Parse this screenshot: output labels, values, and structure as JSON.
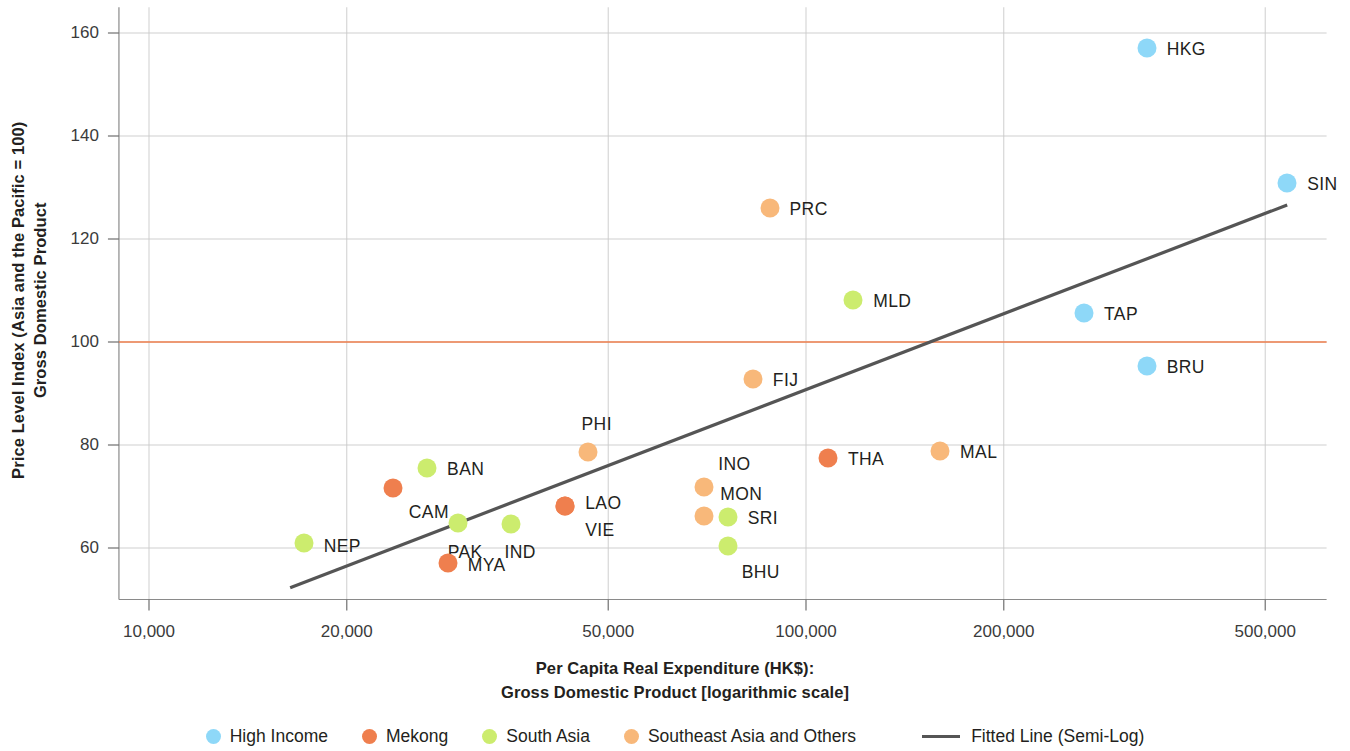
{
  "chart_data": {
    "type": "scatter",
    "title": "",
    "xlabel": "Per Capita Real Expenditure (HK$): Gross Domestic Product [logarithmic scale]",
    "xlabel_line1": "Per Capita Real Expenditure (HK$):",
    "xlabel_line2": "Gross Domestic Product [logarithmic scale]",
    "ylabel": "Price Level Index (Asia and the Pacific = 100) Gross Domestic Product",
    "ylabel_line1": "Price Level Index (Asia and the Pacific = 100)",
    "ylabel_line2": "Gross Domestic Product",
    "xscale": "log",
    "xlim": [
      9000,
      620000
    ],
    "ylim": [
      50,
      165
    ],
    "xticks": [
      10000,
      20000,
      50000,
      100000,
      200000,
      500000
    ],
    "xtick_labels": [
      "10,000",
      "20,000",
      "50,000",
      "100,000",
      "200,000",
      "500,000"
    ],
    "yticks": [
      60,
      80,
      100,
      120,
      140,
      160
    ],
    "ytick_labels": [
      "60",
      "80",
      "100",
      "120",
      "140",
      "160"
    ],
    "grid": true,
    "reference_line": {
      "y": 100,
      "color": "#ef7f4e"
    },
    "fitted_line": {
      "label": "Fitted Line (Semi-Log)",
      "color": "#555555",
      "x_start": 16400,
      "y_start": 52.3,
      "x_end": 540000,
      "y_end": 126.6
    },
    "groups": [
      {
        "name": "High Income",
        "color": "#8ed8f8"
      },
      {
        "name": "Mekong",
        "color": "#ef7f4e"
      },
      {
        "name": "South Asia",
        "color": "#ccec6e"
      },
      {
        "name": "Southeast Asia and Others",
        "color": "#f8b87a"
      }
    ],
    "points": [
      {
        "code": "HKG",
        "group": "High Income",
        "x": 330000,
        "y": 157.0,
        "label_dx": 20,
        "label_dy": 1
      },
      {
        "code": "SIN",
        "group": "High Income",
        "x": 540000,
        "y": 130.8,
        "label_dx": 20,
        "label_dy": 1
      },
      {
        "code": "TAP",
        "group": "High Income",
        "x": 265000,
        "y": 105.6,
        "label_dx": 20,
        "label_dy": 1
      },
      {
        "code": "BRU",
        "group": "High Income",
        "x": 330000,
        "y": 95.4,
        "label_dx": 20,
        "label_dy": 1
      },
      {
        "code": "PRC",
        "group": "Southeast Asia and Others",
        "x": 88000,
        "y": 126.0,
        "label_dx": 20,
        "label_dy": 1
      },
      {
        "code": "MLD",
        "group": "South Asia",
        "x": 118000,
        "y": 108.2,
        "label_dx": 20,
        "label_dy": 1
      },
      {
        "code": "FIJ",
        "group": "Southeast Asia and Others",
        "x": 83000,
        "y": 92.8,
        "label_dx": 20,
        "label_dy": 1
      },
      {
        "code": "MAL",
        "group": "Southeast Asia and Others",
        "x": 160000,
        "y": 78.9,
        "label_dx": 20,
        "label_dy": 1
      },
      {
        "code": "THA",
        "group": "Mekong",
        "x": 108000,
        "y": 77.4,
        "label_dx": 20,
        "label_dy": 1
      },
      {
        "code": "PHI",
        "group": "Southeast Asia and Others",
        "x": 46500,
        "y": 78.6,
        "label_dx": -6,
        "label_dy": -28
      },
      {
        "code": "BAN",
        "group": "South Asia",
        "x": 26500,
        "y": 75.6,
        "label_dx": 20,
        "label_dy": 1
      },
      {
        "code": "CAM",
        "group": "Mekong",
        "x": 23500,
        "y": 71.7,
        "label_dx": 16,
        "label_dy": 24
      },
      {
        "code": "INO",
        "group": "Southeast Asia and Others",
        "x": 70000,
        "y": 71.9,
        "label_dx": 14,
        "label_dy": -23
      },
      {
        "code": "MON",
        "group": "Southeast Asia and Others",
        "x": 70000,
        "y": 66.3,
        "label_dx": 16,
        "label_dy": -22
      },
      {
        "code": "SRI",
        "group": "South Asia",
        "x": 76000,
        "y": 66.1,
        "label_dx": 20,
        "label_dy": 1
      },
      {
        "code": "LAO",
        "group": "Mekong",
        "x": 43000,
        "y": 68.2,
        "label_dx": 20,
        "label_dy": -3
      },
      {
        "code": "VIE",
        "group": "Mekong",
        "x": 43000,
        "y": 68.2,
        "label_dx": 20,
        "label_dy": 24
      },
      {
        "code": "PAK",
        "group": "South Asia",
        "x": 29500,
        "y": 64.9,
        "label_dx": -10,
        "label_dy": 29
      },
      {
        "code": "IND",
        "group": "South Asia",
        "x": 35500,
        "y": 64.6,
        "label_dx": -6,
        "label_dy": 28
      },
      {
        "code": "BHU",
        "group": "South Asia",
        "x": 76000,
        "y": 60.4,
        "label_dx": 14,
        "label_dy": 26
      },
      {
        "code": "NEP",
        "group": "South Asia",
        "x": 17200,
        "y": 60.9,
        "label_dx": 20,
        "label_dy": 3
      },
      {
        "code": "MYA",
        "group": "Mekong",
        "x": 28500,
        "y": 57.0,
        "label_dx": 20,
        "label_dy": 2
      }
    ]
  },
  "legend": {
    "items": [
      {
        "label": "High Income",
        "type": "dot",
        "color": "#8ed8f8"
      },
      {
        "label": "Mekong",
        "type": "dot",
        "color": "#ef7f4e"
      },
      {
        "label": "South Asia",
        "type": "dot",
        "color": "#ccec6e"
      },
      {
        "label": "Southeast Asia and Others",
        "type": "dot",
        "color": "#f8b87a"
      },
      {
        "label": "Fitted Line (Semi-Log)",
        "type": "line",
        "color": "#555555"
      }
    ]
  }
}
